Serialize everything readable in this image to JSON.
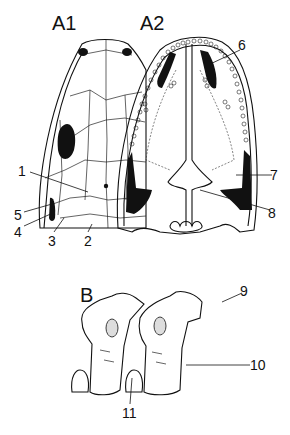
{
  "figure": {
    "panels": [
      {
        "id": "A1",
        "label": "A1",
        "description": "skull, dorsal view"
      },
      {
        "id": "A2",
        "label": "A2",
        "description": "skull, ventral (palatal) view"
      },
      {
        "id": "B",
        "label": "B",
        "description": "vertebrae, lateral view"
      }
    ],
    "callouts": [
      {
        "number": "1",
        "panel": "A1"
      },
      {
        "number": "2",
        "panel": "A1"
      },
      {
        "number": "3",
        "panel": "A1"
      },
      {
        "number": "4",
        "panel": "A1"
      },
      {
        "number": "5",
        "panel": "A1"
      },
      {
        "number": "6",
        "panel": "A2"
      },
      {
        "number": "7",
        "panel": "A2"
      },
      {
        "number": "8",
        "panel": "A2"
      },
      {
        "number": "9",
        "panel": "B"
      },
      {
        "number": "10",
        "panel": "B"
      },
      {
        "number": "11",
        "panel": "B"
      }
    ]
  }
}
